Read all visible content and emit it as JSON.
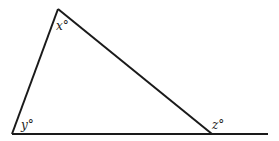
{
  "diagram": {
    "type": "triangle-with-extended-base",
    "stroke_color": "#1a1a1a",
    "vertices": {
      "apex": {
        "x": 58,
        "y": 9
      },
      "bottom_left": {
        "x": 12,
        "y": 134
      },
      "bottom_right": {
        "x": 212,
        "y": 134
      }
    },
    "base_line_end": {
      "x": 268,
      "y": 134
    },
    "angle_labels": {
      "x": "x°",
      "y": "y°",
      "z": "z°"
    }
  }
}
